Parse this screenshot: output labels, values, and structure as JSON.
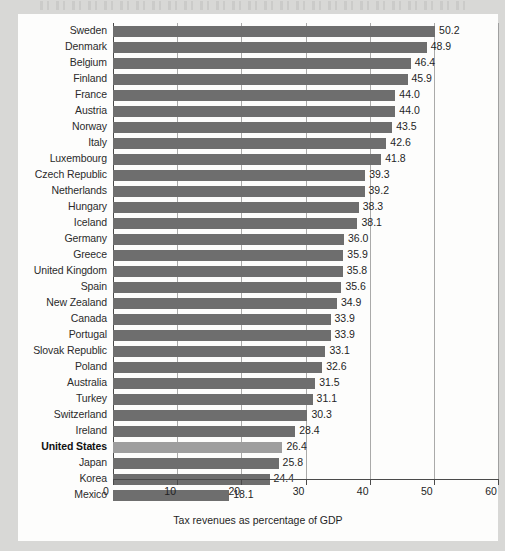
{
  "chart_data": {
    "type": "bar",
    "orientation": "horizontal",
    "title": "",
    "xlabel": "Tax revenues as percentage of GDP",
    "ylabel": "",
    "xlim": [
      0,
      60
    ],
    "xticks": [
      0,
      10,
      20,
      30,
      40,
      50,
      60
    ],
    "xtick_labels": [
      "0",
      "10",
      "20",
      "30",
      "40",
      "50",
      "60"
    ],
    "grid": true,
    "legend": null,
    "bar_color": "#6e6e6e",
    "highlight_color": "#9e9e9e",
    "highlight_category": "United States",
    "categories": [
      "Sweden",
      "Denmark",
      "Belgium",
      "Finland",
      "France",
      "Austria",
      "Norway",
      "Italy",
      "Luxembourg",
      "Czech Republic",
      "Netherlands",
      "Hungary",
      "Iceland",
      "Germany",
      "Greece",
      "United Kingdom",
      "Spain",
      "New Zealand",
      "Canada",
      "Portugal",
      "Slovak Republic",
      "Poland",
      "Australia",
      "Turkey",
      "Switzerland",
      "Ireland",
      "United States",
      "Japan",
      "Korea",
      "Mexico"
    ],
    "values": [
      50.2,
      48.9,
      46.4,
      45.9,
      44.0,
      44.0,
      43.5,
      42.6,
      41.8,
      39.3,
      39.2,
      38.3,
      38.1,
      36.0,
      35.9,
      35.8,
      35.6,
      34.9,
      33.9,
      33.9,
      33.1,
      32.6,
      31.5,
      31.1,
      30.3,
      28.4,
      26.4,
      25.8,
      24.4,
      18.1
    ],
    "value_labels": [
      "50.2",
      "48.9",
      "46.4",
      "45.9",
      "44.0",
      "44.0",
      "43.5",
      "42.6",
      "41.8",
      "39.3",
      "39.2",
      "38.3",
      "38.1",
      "36.0",
      "35.9",
      "35.8",
      "35.6",
      "34.9",
      "33.9",
      "33.9",
      "33.1",
      "32.6",
      "31.5",
      "31.1",
      "30.3",
      "28.4",
      "26.4",
      "25.8",
      "24.4",
      "18.1"
    ]
  }
}
